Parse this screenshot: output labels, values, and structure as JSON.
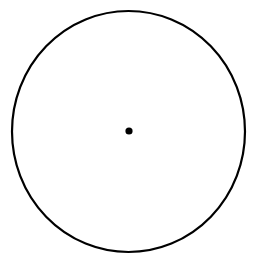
{
  "figure": {
    "canvas": {
      "width": 254,
      "height": 260,
      "background_color": "#ffffff"
    },
    "shapes": {
      "outline": {
        "name": "circle-outline",
        "type": "ellipse",
        "center_x": 128.5,
        "center_y": 131.5,
        "radius_x": 116.5,
        "radius_y": 120.5,
        "stroke_color": "#000000",
        "stroke_width": 2.2,
        "fill": "none"
      },
      "center_point": {
        "name": "center-point-dot",
        "type": "circle",
        "center_x": 129,
        "center_y": 131,
        "radius": 3.6,
        "fill_color": "#000000",
        "stroke": "none"
      }
    }
  }
}
